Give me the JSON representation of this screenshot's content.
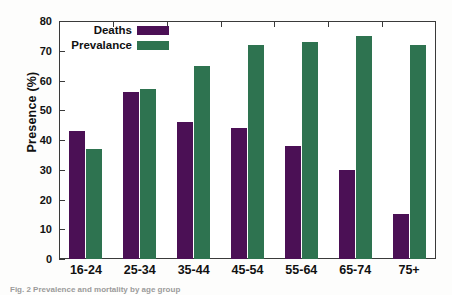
{
  "chart_data": {
    "type": "bar",
    "title": "",
    "xlabel": "",
    "ylabel": "Presence (%)",
    "ylim": [
      0,
      80
    ],
    "yticks": [
      0,
      10,
      20,
      30,
      40,
      50,
      60,
      70,
      80
    ],
    "grid": false,
    "legend_position": "top-left-inside",
    "categories": [
      "16-24",
      "25-34",
      "35-44",
      "45-54",
      "55-64",
      "65-74",
      "75+"
    ],
    "series": [
      {
        "name": "Deaths",
        "color": "#4b1055",
        "values": [
          43,
          56,
          46,
          44,
          38,
          30,
          15
        ]
      },
      {
        "name": "Prevalance",
        "color": "#2e7350",
        "values": [
          37,
          57,
          65,
          72,
          73,
          75,
          72
        ]
      }
    ]
  },
  "axis": {
    "y_title": "Presence (%)",
    "y_tick_labels": [
      "0",
      "10",
      "20",
      "30",
      "40",
      "50",
      "60",
      "70",
      "80"
    ],
    "x_tick_labels": [
      "16-24",
      "25-34",
      "35-44",
      "45-54",
      "55-64",
      "65-74",
      "75+"
    ]
  },
  "legend": {
    "entries": [
      {
        "label": "Deaths",
        "color": "#4b1055"
      },
      {
        "label": "Prevalance",
        "color": "#2e7350"
      }
    ]
  },
  "caption": {
    "text": "Fig. 2 Prevalence and mortality by age group"
  },
  "colors": {
    "deaths": "#4b1055",
    "prevalence": "#2e7350",
    "axis": "#3a3a3a",
    "text": "#111111",
    "background": "#ffffff"
  }
}
